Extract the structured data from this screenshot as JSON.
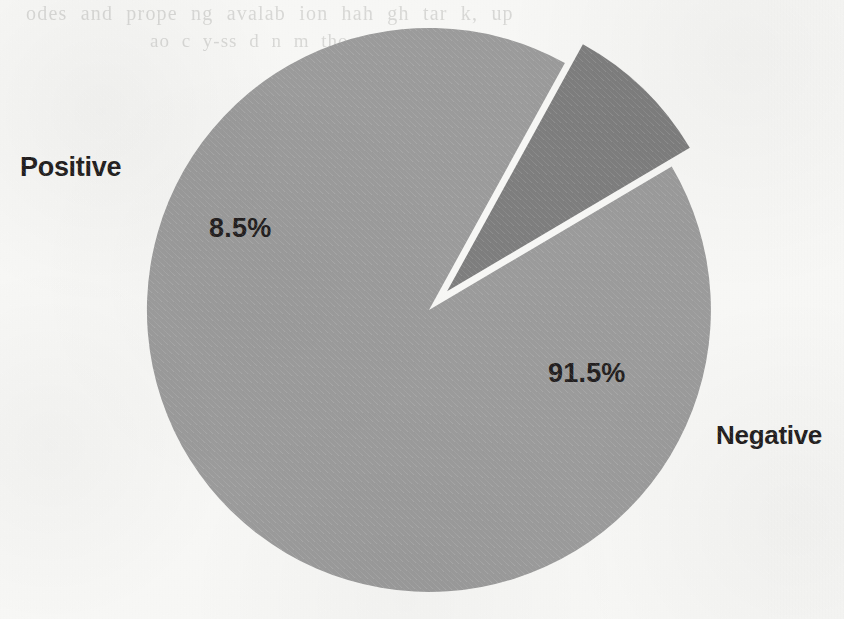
{
  "page": {
    "background_color": "#f7f7f5",
    "ghost_text": {
      "line1": "odes  and  prope ng  avalab  ion  hah  gh  tar k,  up",
      "line2": "ao  c  y-ss d  n m  tho"
    }
  },
  "chart_data": {
    "type": "pie",
    "title": "",
    "categories": [
      "Positive",
      "Negative"
    ],
    "values": [
      8.5,
      91.5
    ],
    "value_labels": [
      "8.5%",
      "91.5%"
    ],
    "unit": "%",
    "legend": "none",
    "slices": [
      {
        "name": "Positive",
        "value": 8.5,
        "value_label": "8.5%",
        "color": "#7e7e7e",
        "exploded": true,
        "category_label": "Positive"
      },
      {
        "name": "Negative",
        "value": 91.5,
        "value_label": "91.5%",
        "color": "#9b9b9b",
        "exploded": false,
        "category_label": "Negative"
      }
    ],
    "colors": {
      "positive_slice": "#7e7e7e",
      "negative_slice": "#9b9b9b",
      "label_text": "#231f20",
      "slice_gap": "#f7f7f5"
    }
  },
  "labels": {
    "positive": "Positive",
    "negative": "Negative",
    "positive_value": "8.5%",
    "negative_value": "91.5%"
  }
}
